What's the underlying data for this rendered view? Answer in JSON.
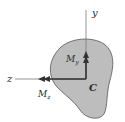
{
  "figure": {
    "colors": {
      "section_fill": "#bdbdbd",
      "section_stroke": "#555555",
      "axis": "#7a7a7a",
      "vector": "#333333",
      "text": "#2a2a2a"
    },
    "axes": {
      "y_label": "y",
      "z_label": "z"
    },
    "centroid_label": "C",
    "moments": [
      {
        "symbol": "M",
        "subscript": "y",
        "direction": "up"
      },
      {
        "symbol": "M",
        "subscript": "z",
        "direction": "left"
      }
    ]
  }
}
